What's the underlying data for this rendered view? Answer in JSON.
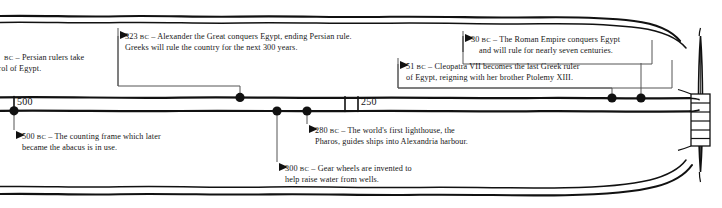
{
  "figure": {
    "kind": "scroll-timeline",
    "ink_color": "#111111",
    "paper_color": "#ffffff",
    "connector_color": "#555555"
  },
  "timeline": {
    "axis_labels": [
      {
        "id": "tick-500",
        "text": "500",
        "x": 14
      },
      {
        "id": "tick-250",
        "text": "250",
        "x": 352
      }
    ],
    "markers": [
      {
        "id": "marker-500bc",
        "year": "500 BC",
        "x": 14,
        "side": "bottom"
      },
      {
        "id": "marker-323bc",
        "year": "323 BC",
        "x": 240,
        "side": "top"
      },
      {
        "id": "marker-300bc",
        "year": "300 BC",
        "x": 277,
        "side": "bottom"
      },
      {
        "id": "marker-280bc",
        "year": "280 BC",
        "x": 307,
        "side": "bottom"
      },
      {
        "id": "marker-51bc",
        "year": "51 BC",
        "x": 612,
        "side": "top"
      },
      {
        "id": "marker-30bc",
        "year": "30 BC",
        "x": 641,
        "side": "top"
      }
    ]
  },
  "notes": {
    "persia": {
      "id": "note-persian-rulers",
      "year": "",
      "bc": "BC",
      "dash": "–",
      "line1": " Persian rulers take",
      "line2": "trol of Egypt.",
      "clipped": true
    },
    "alexander": {
      "id": "note-alexander",
      "year": "323",
      "bc": "BC",
      "dash": "–",
      "line1": "Alexander the Great conquers Egypt, ending Persian rule.",
      "line2": "Greeks will rule the country for the next 300 years."
    },
    "abacus": {
      "id": "note-abacus",
      "year": "500",
      "bc": "BC",
      "dash": "–",
      "line1": " The counting frame which later",
      "line2": "became the abacus is in use."
    },
    "gears": {
      "id": "note-gear-wheels",
      "year": "300",
      "bc": "BC",
      "dash": "–",
      "line1": "Gear wheels are invented to",
      "line2": "help raise water from wells."
    },
    "pharos": {
      "id": "note-pharos",
      "year": "280",
      "bc": "BC",
      "dash": "–",
      "line1": "The world's first lighthouse, the",
      "line2": "Pharos, guides ships into Alexandria harbour."
    },
    "cleopatra": {
      "id": "note-cleopatra",
      "year": "51",
      "bc": "BC",
      "dash": "–",
      "line1": "Cleopatra VII becomes the last Greek ruler",
      "line2": "of Egypt, reigning with her brother Ptolemy XIII."
    },
    "rome": {
      "id": "note-roman-empire",
      "year": "30",
      "bc": "BC",
      "dash": "–",
      "line1": "The Roman Empire conquers Egypt",
      "line2": "and will rule for nearly seven centuries."
    }
  }
}
